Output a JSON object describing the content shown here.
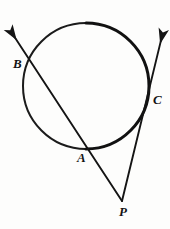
{
  "figure": {
    "background_color": "#fdfdfc",
    "stroke_color": "#141414",
    "labels": {
      "B": "B",
      "A": "A",
      "C": "C",
      "P": "P"
    }
  },
  "chart_data": {
    "type": "diagram",
    "title": "",
    "shapes": [
      {
        "name": "circle",
        "kind": "circle",
        "cx": 86,
        "cy": 86,
        "r": 63,
        "stroke": "#141414",
        "stroke_width": 2.6,
        "fill": "none"
      },
      {
        "name": "secant-line-BAP",
        "kind": "ray",
        "from": [
          10,
          30
        ],
        "through": [
          31,
          62
        ],
        "to": [
          122,
          201
        ],
        "arrow_at": "from",
        "stroke": "#141414",
        "stroke_width": 1.9
      },
      {
        "name": "line-PCA-upper",
        "kind": "ray",
        "from": [
          122,
          201
        ],
        "through": [
          148,
          110
        ],
        "to": [
          163,
          32
        ],
        "arrow_at": "to",
        "stroke": "#141414",
        "stroke_width": 1.9
      }
    ],
    "points": [
      {
        "label": "B",
        "x": 31,
        "y": 62,
        "label_x": 17,
        "label_y": 64,
        "description": "secant intersection with circle, upper left"
      },
      {
        "label": "A",
        "x": 86,
        "y": 147,
        "label_x": 81,
        "label_y": 158,
        "description": "secant intersection with circle, lower"
      },
      {
        "label": "C",
        "x": 148,
        "y": 110,
        "label_x": 157,
        "label_y": 100,
        "description": "line PC intersection with circle, right"
      },
      {
        "label": "P",
        "x": 122,
        "y": 201,
        "label_x": 123,
        "label_y": 212,
        "description": "external vertex where the two lines meet"
      }
    ],
    "axis_ranges": {
      "x": [
        0,
        170
      ],
      "y": [
        0,
        229
      ]
    },
    "grid": false,
    "legend": null
  }
}
